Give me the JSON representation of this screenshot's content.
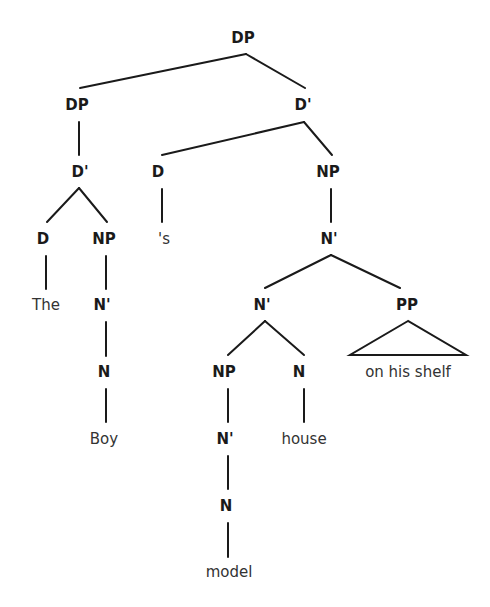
{
  "diagram": {
    "type": "syntax-tree",
    "nodes": {
      "root_dp": "DP",
      "spec_dp": "DP",
      "d_bar_top": "D'",
      "spec_d_bar": "D'",
      "d_poss": "D",
      "np_main": "NP",
      "d_the": "D",
      "np_boy": "NP",
      "poss_s": "'s",
      "n_bar_main": "N'",
      "the_word": "The",
      "n_bar_boy": "N'",
      "n_bar_inner": "N'",
      "pp": "PP",
      "n_boy": "N",
      "np_model": "NP",
      "n_house": "N",
      "pp_text": "on his shelf",
      "boy_word": "Boy",
      "n_bar_model": "N'",
      "house_word": "house",
      "n_model": "N",
      "model_word": "model"
    },
    "edges": [
      [
        "DP",
        "DP"
      ],
      [
        "DP",
        "D'"
      ],
      [
        "DP",
        "D'"
      ],
      [
        "D'",
        "D"
      ],
      [
        "D'",
        "NP"
      ],
      [
        "D'",
        "D"
      ],
      [
        "D'",
        "NP"
      ],
      [
        "D",
        "'s"
      ],
      [
        "NP",
        "N'"
      ],
      [
        "D",
        "The"
      ],
      [
        "NP",
        "N'"
      ],
      [
        "N'",
        "N'"
      ],
      [
        "N'",
        "PP"
      ],
      [
        "N'",
        "N"
      ],
      [
        "N",
        "Boy"
      ],
      [
        "N'",
        "NP"
      ],
      [
        "N'",
        "N"
      ],
      [
        "PP",
        "on his shelf (triangle)"
      ],
      [
        "NP",
        "N'"
      ],
      [
        "N",
        "house"
      ],
      [
        "N'",
        "N"
      ],
      [
        "N",
        "model"
      ]
    ],
    "line_color": "#1a1a1a"
  }
}
